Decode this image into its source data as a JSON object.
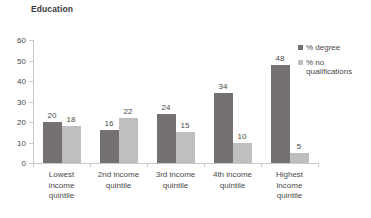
{
  "chart_data": {
    "type": "bar",
    "title": "Education",
    "xlabel": "",
    "ylabel": "",
    "ylim": [
      0,
      60
    ],
    "yticks": [
      0,
      10,
      20,
      30,
      40,
      50,
      60
    ],
    "grid": false,
    "legend_position": "right",
    "categories": [
      "Lowest\nincome\nquintile",
      "2nd income\nquintile",
      "3rd income\nquintile",
      "4th income\nquintile",
      "Highest\nincome\nquintile"
    ],
    "series": [
      {
        "name": "% degree",
        "color": "#767171",
        "values": [
          20,
          16,
          24,
          34,
          48
        ]
      },
      {
        "name": "% no qualifications",
        "color": "#bfbfbf",
        "values": [
          18,
          22,
          15,
          10,
          5
        ]
      }
    ]
  },
  "legend": {
    "items": [
      {
        "label": "% degree"
      },
      {
        "label": "% no qualifications"
      }
    ]
  },
  "colors": {
    "series_degree": "#767171",
    "series_no_qualifications": "#bfbfbf",
    "axis": "#c9c9c9",
    "text": "#4a4a4a",
    "title": "#3a3a3a",
    "background": "#ffffff"
  }
}
